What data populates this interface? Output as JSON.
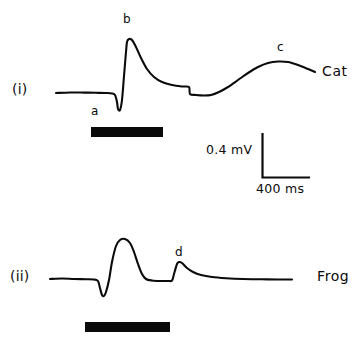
{
  "figure": {
    "width": 364,
    "height": 344,
    "background": "#ffffff",
    "ink_color": "#0b0b0b"
  },
  "panels": [
    {
      "id": "panel-i",
      "panel_label": "(i)",
      "species_label": "Cat",
      "wave_marks": [
        {
          "name": "a",
          "label": "a"
        },
        {
          "name": "b",
          "label": "b"
        },
        {
          "name": "c",
          "label": "c"
        }
      ],
      "stimulus_bar": {
        "name": "stimulus-bar-cat"
      }
    },
    {
      "id": "panel-ii",
      "panel_label": "(ii)",
      "species_label": "Frog",
      "wave_marks": [
        {
          "name": "d",
          "label": "d"
        }
      ],
      "stimulus_bar": {
        "name": "stimulus-bar-frog"
      }
    }
  ],
  "scale_bar": {
    "voltage_label": "0.4 mV",
    "time_label": "400 ms"
  },
  "chart_data": {
    "type": "line",
    "title": "",
    "xlabel": "",
    "ylabel": "",
    "grid": false,
    "legend": "none",
    "calibration": {
      "voltage": {
        "value": 0.4,
        "unit": "mV"
      },
      "time": {
        "value": 400,
        "unit": "ms"
      }
    },
    "series": [
      {
        "name": "Cat",
        "panel": "(i)",
        "annotations": [
          {
            "label": "a",
            "description": "initial downward deflection"
          },
          {
            "label": "b",
            "description": "large fast positive peak"
          },
          {
            "label": "c",
            "description": "slow late positive wave"
          }
        ],
        "points": [
          [
            56,
            93
          ],
          [
            70,
            92.5
          ],
          [
            84,
            92.6
          ],
          [
            96,
            92.8
          ],
          [
            106,
            93
          ],
          [
            112,
            93.4
          ],
          [
            115,
            95
          ],
          [
            117,
            102
          ],
          [
            118,
            109
          ],
          [
            120,
            110
          ],
          [
            122,
            100
          ],
          [
            124,
            76
          ],
          [
            126,
            52
          ],
          [
            127,
            42
          ],
          [
            129,
            39
          ],
          [
            132,
            40
          ],
          [
            136,
            47
          ],
          [
            141,
            58
          ],
          [
            147,
            69
          ],
          [
            154,
            77
          ],
          [
            162,
            82
          ],
          [
            172,
            85
          ],
          [
            182,
            86.5
          ],
          [
            189,
            87
          ],
          [
            190,
            94
          ],
          [
            196,
            95
          ],
          [
            204,
            95.5
          ],
          [
            211,
            95
          ],
          [
            219,
            92
          ],
          [
            228,
            87
          ],
          [
            238,
            80
          ],
          [
            248,
            73
          ],
          [
            258,
            67
          ],
          [
            268,
            63
          ],
          [
            278,
            61.5
          ],
          [
            288,
            62
          ],
          [
            298,
            65
          ],
          [
            308,
            69
          ],
          [
            315,
            72
          ]
        ]
      },
      {
        "name": "Frog",
        "panel": "(ii)",
        "annotations": [
          {
            "label": "d",
            "description": "secondary slow positive bump"
          }
        ],
        "points": [
          [
            50,
            279
          ],
          [
            62,
            278.5
          ],
          [
            74,
            279
          ],
          [
            86,
            279.2
          ],
          [
            94,
            279.5
          ],
          [
            98,
            281
          ],
          [
            100,
            288
          ],
          [
            102,
            295
          ],
          [
            104,
            296
          ],
          [
            106,
            292
          ],
          [
            109,
            280
          ],
          [
            112,
            262
          ],
          [
            116,
            246
          ],
          [
            120,
            240
          ],
          [
            125,
            239
          ],
          [
            130,
            243
          ],
          [
            134,
            252
          ],
          [
            138,
            264
          ],
          [
            142,
            274
          ],
          [
            146,
            279
          ],
          [
            152,
            280.5
          ],
          [
            160,
            281
          ],
          [
            168,
            281
          ],
          [
            172,
            280.5
          ],
          [
            174,
            274
          ],
          [
            177,
            264
          ],
          [
            179,
            262
          ],
          [
            182,
            263
          ],
          [
            187,
            268
          ],
          [
            193,
            272
          ],
          [
            201,
            275
          ],
          [
            212,
            277
          ],
          [
            226,
            278.2
          ],
          [
            243,
            279
          ],
          [
            262,
            279.3
          ],
          [
            278,
            279.5
          ],
          [
            292,
            279.5
          ]
        ]
      }
    ]
  }
}
